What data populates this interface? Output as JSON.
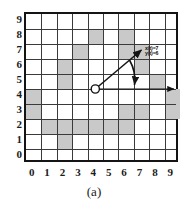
{
  "figure": {
    "caption": "(a)",
    "type": "occupancy-grid-diagram"
  },
  "axes": {
    "x_ticks": [
      "0",
      "1",
      "2",
      "3",
      "4",
      "5",
      "6",
      "7",
      "8",
      "9"
    ],
    "y_ticks": [
      "9",
      "8",
      "7",
      "6",
      "5",
      "4",
      "3",
      "2",
      "1",
      "0"
    ],
    "x_range": [
      0,
      9
    ],
    "y_range": [
      0,
      9
    ],
    "grid": true
  },
  "annotations": {
    "state_x": "x(t)=7",
    "state_y": "y(t)=6"
  },
  "colors": {
    "obstacle": "#c9c9c9",
    "gridline": "#3a3a3a",
    "border": "#141414",
    "ink": "#111111",
    "background": "#ffffff"
  },
  "chart_data": {
    "type": "heatmap",
    "title": "",
    "subtitle": "",
    "xlabel": "",
    "ylabel": "",
    "xlim": [
      0,
      10
    ],
    "ylim": [
      0,
      10
    ],
    "grid": true,
    "legend_position": "none",
    "categories": [
      "0",
      "1",
      "2",
      "3",
      "4",
      "5",
      "6",
      "7",
      "8",
      "9"
    ],
    "occupied_cells": [
      [
        4,
        8
      ],
      [
        6,
        8
      ],
      [
        3,
        7
      ],
      [
        6,
        7
      ],
      [
        7,
        7
      ],
      [
        2,
        6
      ],
      [
        7,
        6
      ],
      [
        2,
        5
      ],
      [
        8,
        5
      ],
      [
        0,
        4
      ],
      [
        9,
        4
      ],
      [
        0,
        3
      ],
      [
        6,
        3
      ],
      [
        7,
        3
      ],
      [
        9,
        3
      ],
      [
        1,
        2
      ],
      [
        2,
        2
      ],
      [
        3,
        2
      ],
      [
        4,
        2
      ],
      [
        5,
        2
      ],
      [
        6,
        2
      ],
      [
        2,
        1
      ]
    ],
    "occupancy_matrix": [
      [
        0,
        0,
        0,
        0,
        0,
        0,
        0,
        0,
        0,
        0
      ],
      [
        0,
        0,
        0,
        0,
        1,
        0,
        1,
        0,
        0,
        0
      ],
      [
        0,
        0,
        0,
        1,
        0,
        0,
        1,
        1,
        0,
        0
      ],
      [
        0,
        0,
        1,
        0,
        0,
        0,
        0,
        1,
        0,
        0
      ],
      [
        0,
        0,
        1,
        0,
        0,
        0,
        0,
        0,
        1,
        0
      ],
      [
        1,
        0,
        0,
        0,
        0,
        0,
        0,
        0,
        0,
        1
      ],
      [
        1,
        0,
        0,
        0,
        0,
        0,
        1,
        1,
        0,
        1
      ],
      [
        0,
        1,
        1,
        1,
        1,
        1,
        1,
        0,
        0,
        0
      ],
      [
        0,
        0,
        1,
        0,
        0,
        0,
        0,
        0,
        0,
        0
      ],
      [
        0,
        0,
        0,
        0,
        0,
        0,
        0,
        0,
        0,
        0
      ]
    ],
    "matrix_row_order": "top row is y=9, bottom row is y=0",
    "robot": {
      "position": [
        4.5,
        4.0
      ],
      "heading_endpoint": [
        7.6,
        6.6
      ],
      "reference_endpoint": [
        9.4,
        4.0
      ],
      "marker": "open-circle"
    },
    "annotations": [
      {
        "text": "x(t)=7",
        "at": [
          8.1,
          6.9
        ]
      },
      {
        "text": "y(t)=6",
        "at": [
          8.1,
          6.4
        ]
      }
    ]
  }
}
